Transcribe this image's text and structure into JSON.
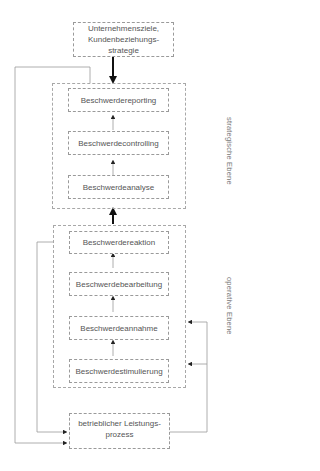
{
  "diagram": {
    "top_box": {
      "label": "Unternehmensziele, Kundenbeziehungs-strategie",
      "lines": [
        "Unternehmensziele,",
        "Kundenbeziehungs-",
        "strategie"
      ]
    },
    "strategic_level": {
      "label": "strategische Ebene",
      "steps": [
        "Beschwerdereporting",
        "Beschwerdecontrolling",
        "Beschwerdeanalyse"
      ]
    },
    "operative_level": {
      "label": "operative Ebene",
      "steps": [
        "Beschwerdereaktion",
        "Beschwerdebearbeitung",
        "Beschwerdeannahme",
        "Beschwerdestimulierung"
      ]
    },
    "bottom_box": {
      "label": "betrieblicher Leistungs-prozess",
      "lines": [
        "betrieblicher Leistungs-",
        "prozess"
      ]
    },
    "colors": {
      "line": "#8a8a8a",
      "border": "#9a9a9a",
      "text": "#555555",
      "arrow_strong": "#111111"
    }
  }
}
